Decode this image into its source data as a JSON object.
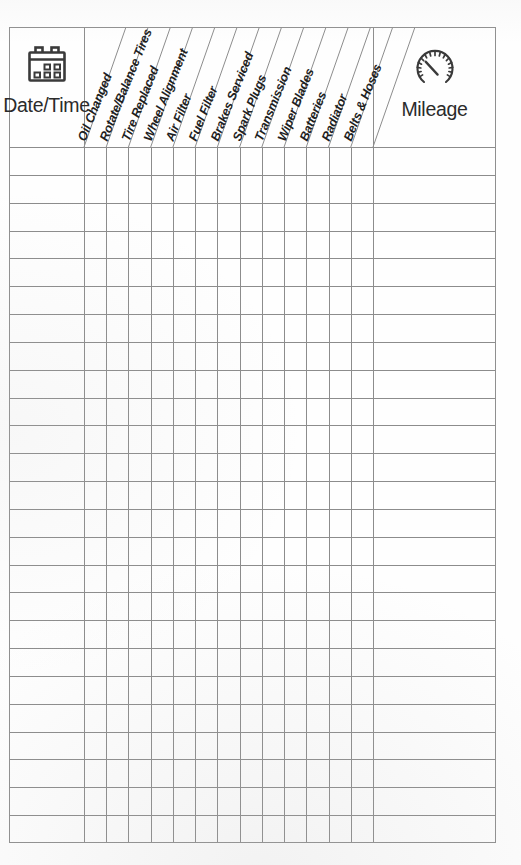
{
  "document": {
    "type": "vehicle-maintenance-log-sheet",
    "orientation": "portrait"
  },
  "table": {
    "first_column": {
      "label": "Date/Time",
      "icon": "calendar-icon"
    },
    "last_column": {
      "label": "Mileage",
      "icon": "speedometer-gauge-icon"
    },
    "service_columns": [
      {
        "label": "Oil Changed"
      },
      {
        "label": "Rotate/Balance Tires"
      },
      {
        "label": "Tire Replaced"
      },
      {
        "label": "Wheel Alignment"
      },
      {
        "label": "Air Filter"
      },
      {
        "label": "Fuel Filter"
      },
      {
        "label": "Brakes Serviced"
      },
      {
        "label": "Spark Plugs"
      },
      {
        "label": "Transmission"
      },
      {
        "label": "Wiper Blades"
      },
      {
        "label": "Batteries"
      },
      {
        "label": "Radiator"
      },
      {
        "label": "Belts & Hoses"
      }
    ],
    "row_count": 25,
    "rows": [
      {
        "date_time": "",
        "mileage": "",
        "checks": [
          "",
          "",
          "",
          "",
          "",
          "",
          "",
          "",
          "",
          "",
          "",
          "",
          ""
        ]
      },
      {
        "date_time": "",
        "mileage": "",
        "checks": [
          "",
          "",
          "",
          "",
          "",
          "",
          "",
          "",
          "",
          "",
          "",
          "",
          ""
        ]
      },
      {
        "date_time": "",
        "mileage": "",
        "checks": [
          "",
          "",
          "",
          "",
          "",
          "",
          "",
          "",
          "",
          "",
          "",
          "",
          ""
        ]
      },
      {
        "date_time": "",
        "mileage": "",
        "checks": [
          "",
          "",
          "",
          "",
          "",
          "",
          "",
          "",
          "",
          "",
          "",
          "",
          ""
        ]
      },
      {
        "date_time": "",
        "mileage": "",
        "checks": [
          "",
          "",
          "",
          "",
          "",
          "",
          "",
          "",
          "",
          "",
          "",
          "",
          ""
        ]
      },
      {
        "date_time": "",
        "mileage": "",
        "checks": [
          "",
          "",
          "",
          "",
          "",
          "",
          "",
          "",
          "",
          "",
          "",
          "",
          ""
        ]
      },
      {
        "date_time": "",
        "mileage": "",
        "checks": [
          "",
          "",
          "",
          "",
          "",
          "",
          "",
          "",
          "",
          "",
          "",
          "",
          ""
        ]
      },
      {
        "date_time": "",
        "mileage": "",
        "checks": [
          "",
          "",
          "",
          "",
          "",
          "",
          "",
          "",
          "",
          "",
          "",
          "",
          ""
        ]
      },
      {
        "date_time": "",
        "mileage": "",
        "checks": [
          "",
          "",
          "",
          "",
          "",
          "",
          "",
          "",
          "",
          "",
          "",
          "",
          ""
        ]
      },
      {
        "date_time": "",
        "mileage": "",
        "checks": [
          "",
          "",
          "",
          "",
          "",
          "",
          "",
          "",
          "",
          "",
          "",
          "",
          ""
        ]
      },
      {
        "date_time": "",
        "mileage": "",
        "checks": [
          "",
          "",
          "",
          "",
          "",
          "",
          "",
          "",
          "",
          "",
          "",
          "",
          ""
        ]
      },
      {
        "date_time": "",
        "mileage": "",
        "checks": [
          "",
          "",
          "",
          "",
          "",
          "",
          "",
          "",
          "",
          "",
          "",
          "",
          ""
        ]
      },
      {
        "date_time": "",
        "mileage": "",
        "checks": [
          "",
          "",
          "",
          "",
          "",
          "",
          "",
          "",
          "",
          "",
          "",
          "",
          ""
        ]
      },
      {
        "date_time": "",
        "mileage": "",
        "checks": [
          "",
          "",
          "",
          "",
          "",
          "",
          "",
          "",
          "",
          "",
          "",
          "",
          ""
        ]
      },
      {
        "date_time": "",
        "mileage": "",
        "checks": [
          "",
          "",
          "",
          "",
          "",
          "",
          "",
          "",
          "",
          "",
          "",
          "",
          ""
        ]
      },
      {
        "date_time": "",
        "mileage": "",
        "checks": [
          "",
          "",
          "",
          "",
          "",
          "",
          "",
          "",
          "",
          "",
          "",
          "",
          ""
        ]
      },
      {
        "date_time": "",
        "mileage": "",
        "checks": [
          "",
          "",
          "",
          "",
          "",
          "",
          "",
          "",
          "",
          "",
          "",
          "",
          ""
        ]
      },
      {
        "date_time": "",
        "mileage": "",
        "checks": [
          "",
          "",
          "",
          "",
          "",
          "",
          "",
          "",
          "",
          "",
          "",
          "",
          ""
        ]
      },
      {
        "date_time": "",
        "mileage": "",
        "checks": [
          "",
          "",
          "",
          "",
          "",
          "",
          "",
          "",
          "",
          "",
          "",
          "",
          ""
        ]
      },
      {
        "date_time": "",
        "mileage": "",
        "checks": [
          "",
          "",
          "",
          "",
          "",
          "",
          "",
          "",
          "",
          "",
          "",
          "",
          ""
        ]
      },
      {
        "date_time": "",
        "mileage": "",
        "checks": [
          "",
          "",
          "",
          "",
          "",
          "",
          "",
          "",
          "",
          "",
          "",
          "",
          ""
        ]
      },
      {
        "date_time": "",
        "mileage": "",
        "checks": [
          "",
          "",
          "",
          "",
          "",
          "",
          "",
          "",
          "",
          "",
          "",
          "",
          ""
        ]
      },
      {
        "date_time": "",
        "mileage": "",
        "checks": [
          "",
          "",
          "",
          "",
          "",
          "",
          "",
          "",
          "",
          "",
          "",
          "",
          ""
        ]
      },
      {
        "date_time": "",
        "mileage": "",
        "checks": [
          "",
          "",
          "",
          "",
          "",
          "",
          "",
          "",
          "",
          "",
          "",
          "",
          ""
        ]
      },
      {
        "date_time": "",
        "mileage": "",
        "checks": [
          "",
          "",
          "",
          "",
          "",
          "",
          "",
          "",
          "",
          "",
          "",
          "",
          ""
        ]
      }
    ]
  },
  "style": {
    "grid_line_color": "#8c8c8c",
    "border_color": "#8f8f8f",
    "text_color": "#1f1f1f",
    "paper_color": "#fefefe"
  }
}
